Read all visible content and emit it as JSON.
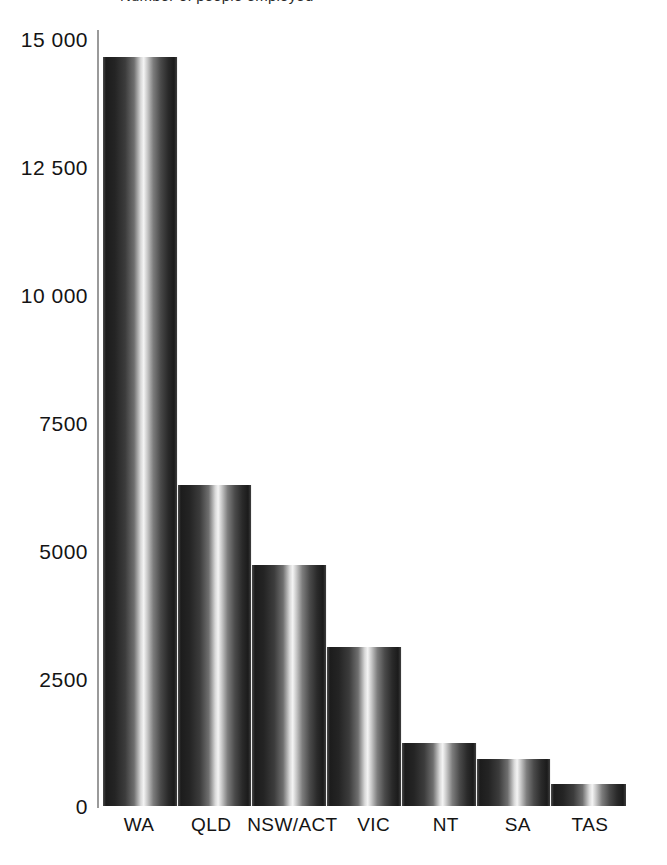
{
  "figure": {
    "top_caption_partial": "Number of people employed",
    "background_color": "#ffffff",
    "bar_dark_color": "#1c1c1c",
    "bar_highlight_color": "#f4f4f4",
    "axis_color": "#9a9a9a",
    "text_color": "#141414"
  },
  "chart_data": {
    "type": "bar",
    "title": "",
    "xlabel": "",
    "ylabel": "",
    "categories": [
      "WA",
      "QLD",
      "NSW/ACT",
      "VIC",
      "NT",
      "SA",
      "TAS"
    ],
    "values": [
      14600,
      6250,
      4700,
      3100,
      1220,
      920,
      430
    ],
    "ylim": [
      0,
      15000
    ],
    "ytick_values": [
      15000,
      12500,
      10000,
      7500,
      5000,
      2500,
      0
    ],
    "ytick_labels": [
      "15 000",
      "12 500",
      "10 000",
      "7500",
      "5000",
      "2500",
      "0"
    ],
    "grid": false,
    "legend": null,
    "legend_position": "none",
    "bar_style": "metallic-cylinder-gradient",
    "bars_touching": true
  }
}
